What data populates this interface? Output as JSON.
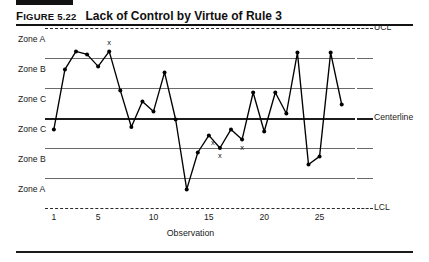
{
  "figure": {
    "label_prefix": "F",
    "label": "IGURE",
    "number": "5.22",
    "caption": "Lack of Control by Virtue of Rule 3"
  },
  "zone_labels": [
    "Zone A",
    "Zone B",
    "Zone C",
    "Zone C",
    "Zone B",
    "Zone A"
  ],
  "limit_labels": {
    "upper": "UCL",
    "center": "Centerline",
    "lower": "LCL"
  },
  "colors": {
    "ink": "#121212",
    "zone_line": "#6a6a6a",
    "center_line": "#1c1c1c",
    "limit_line": "#2a2a2a",
    "series": "#000000"
  },
  "chart_data": {
    "type": "line",
    "title": "Lack of Control by Virtue of Rule 3",
    "xlabel": "Observation",
    "ylabel": "",
    "grid": true,
    "legend_position": "right",
    "xlim": [
      0.2,
      28.2
    ],
    "ylim": [
      0,
      6
    ],
    "xticks": [
      1,
      5,
      10,
      15,
      20,
      25
    ],
    "xtick_labels": [
      "1",
      "5",
      "10",
      "15",
      "20",
      "25"
    ],
    "zone_boundaries": [
      {
        "name": "UCL",
        "value": 6,
        "style": "dashed"
      },
      {
        "name": "Zone A / Zone B upper",
        "value": 5,
        "style": "solid"
      },
      {
        "name": "Zone B / Zone C upper",
        "value": 4,
        "style": "solid"
      },
      {
        "name": "Centerline",
        "value": 3,
        "style": "thick"
      },
      {
        "name": "Zone C / Zone B lower",
        "value": 2,
        "style": "solid"
      },
      {
        "name": "Zone B / Zone A lower",
        "value": 1,
        "style": "solid"
      },
      {
        "name": "LCL",
        "value": 0,
        "style": "dashed"
      }
    ],
    "zone_bands": [
      {
        "label": "Zone A",
        "from": 5,
        "to": 6
      },
      {
        "label": "Zone B",
        "from": 4,
        "to": 5
      },
      {
        "label": "Zone C",
        "from": 3,
        "to": 4
      },
      {
        "label": "Zone C",
        "from": 2,
        "to": 3
      },
      {
        "label": "Zone B",
        "from": 1,
        "to": 2
      },
      {
        "label": "Zone A",
        "from": 0,
        "to": 1
      }
    ],
    "series": [
      {
        "name": "Observation value",
        "x": [
          1,
          2,
          3,
          4,
          5,
          6,
          7,
          8,
          9,
          10,
          11,
          12,
          13,
          14,
          15,
          16,
          17,
          18,
          19,
          20,
          21,
          22,
          23,
          24,
          25,
          26,
          27
        ],
        "values": [
          2.62,
          4.62,
          5.22,
          5.12,
          4.72,
          5.22,
          3.92,
          2.7,
          3.55,
          3.22,
          4.52,
          2.95,
          0.62,
          1.85,
          2.42,
          2.0,
          2.62,
          2.28,
          3.85,
          2.55,
          3.85,
          3.15,
          5.18,
          1.45,
          1.72,
          5.18,
          3.45
        ]
      }
    ],
    "annotations": [
      {
        "text": "x",
        "x": 6,
        "y": 5.22,
        "position": "above"
      },
      {
        "text": "x",
        "x": 16,
        "y": 2.0,
        "position": "below"
      },
      {
        "text": "x",
        "x": 15,
        "y": 2.42,
        "position": "below-right"
      },
      {
        "text": "x",
        "x": 18,
        "y": 2.28,
        "position": "below"
      }
    ]
  }
}
